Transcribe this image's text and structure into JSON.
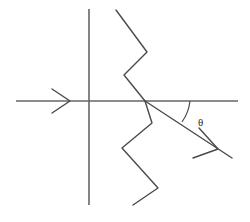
{
  "figure": {
    "title": "",
    "background_color": "#ffffff",
    "line_color": "#4a4a4a",
    "axis_color": "#666666",
    "width": 250,
    "height": 222
  },
  "labels": {
    "theta": "θ",
    "theta_x": 198,
    "theta_y": 122
  },
  "geometry": {
    "horizontal_axis": {
      "x1": 16,
      "y1": 101,
      "x2": 238,
      "y2": 101
    },
    "vertical_axis": {
      "x1": 89,
      "y1": 9,
      "x2": 89,
      "y2": 205
    },
    "origin": {
      "x": 145,
      "y": 101
    },
    "incoming_ray": {
      "x1": 16,
      "y1": 101,
      "x2": 145,
      "y2": 101
    },
    "incoming_arrow_tip": {
      "x": 70,
      "y": 101
    },
    "outgoing_ray": {
      "x1": 145,
      "y1": 101,
      "x2": 232,
      "y2": 158
    },
    "outgoing_arrow_tip": {
      "x": 218,
      "y": 149
    },
    "angle_arc": {
      "cx": 145,
      "cy": 101,
      "radius": 45,
      "start_deg": 0,
      "end_deg": 33
    },
    "upper_wave_points": "116,10 147,52 124,75 145,101",
    "lower_wave_points": "145,101 152,123 122,148 158,188 133,205"
  },
  "icons": {
    "incoming_arrowhead": "arrowhead-right-icon",
    "outgoing_arrowhead": "arrowhead-diagonal-icon"
  }
}
